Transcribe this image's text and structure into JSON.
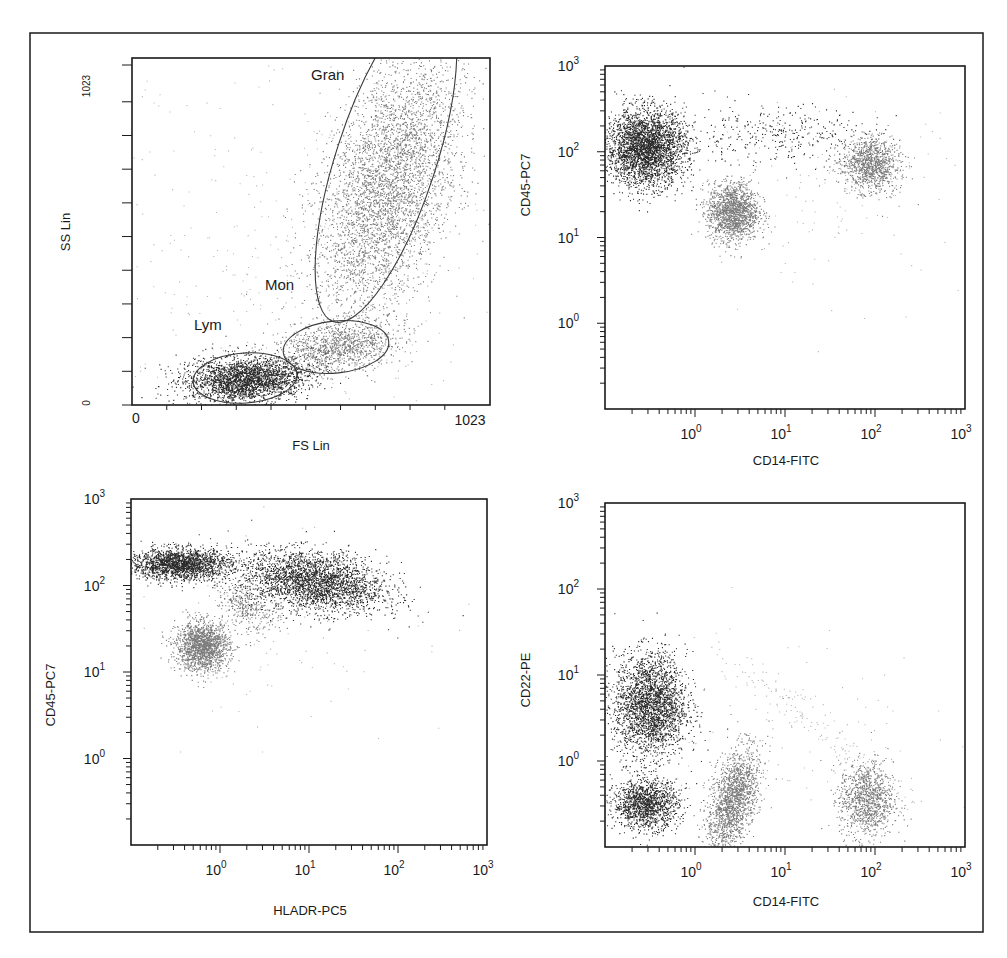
{
  "figure": {
    "frame": {
      "x": 30,
      "y": 33,
      "w": 953,
      "h": 899
    },
    "colors": {
      "dark": "#141414",
      "mid": "#6e6e6e",
      "light": "#9a9a9a",
      "axis": "#1a1a1a"
    }
  },
  "chart_data": [
    {
      "id": "fs-ss",
      "type": "scatter",
      "title": "",
      "xlabel": "FS Lin",
      "ylabel": "SS Lin",
      "scale": "linear",
      "xlim": [
        0,
        1023
      ],
      "ylim": [
        0,
        1023
      ],
      "x_tick_labels": [
        "0",
        "1023"
      ],
      "y_tick_labels": [
        "0",
        "1023"
      ],
      "box": {
        "x": 132,
        "y": 58,
        "w": 358,
        "h": 347
      },
      "gates": [
        {
          "label": "Lym",
          "shape": "ellipse",
          "cx": 245,
          "cy": 378,
          "rx": 52,
          "ry": 25,
          "rot": -4,
          "label_x": 194,
          "label_y": 330
        },
        {
          "label": "Mon",
          "shape": "ellipse",
          "cx": 336,
          "cy": 347,
          "rx": 53,
          "ry": 26,
          "rot": -6,
          "label_x": 265,
          "label_y": 290
        },
        {
          "label": "Gran",
          "shape": "ellipse-clipped",
          "cx": 386,
          "cy": 160,
          "rx": 50,
          "ry": 170,
          "rot": 18,
          "label_x": 311,
          "label_y": 80
        }
      ],
      "clusters": [
        {
          "name": "Lymphocytes",
          "shade": "dark",
          "cx": 245,
          "cy": 379,
          "sx": 30,
          "sy": 11,
          "rot": -3,
          "n": 2600
        },
        {
          "name": "Monocytes",
          "shade": "mid",
          "cx": 338,
          "cy": 346,
          "sx": 30,
          "sy": 12,
          "rot": -8,
          "n": 1100
        },
        {
          "name": "Granulocytes",
          "shade": "mid",
          "cx": 388,
          "cy": 185,
          "sx": 30,
          "sy": 70,
          "rot": 18,
          "n": 4200
        },
        {
          "name": "Debris",
          "shade": "light",
          "cx": 300,
          "cy": 260,
          "sx": 110,
          "sy": 110,
          "rot": 0,
          "n": 500
        }
      ]
    },
    {
      "id": "cd14-cd45",
      "type": "scatter",
      "title": "",
      "xlabel": "CD14-FITC",
      "ylabel": "CD45-PC7",
      "scale": "log",
      "xlim": [
        0.1,
        1000
      ],
      "ylim": [
        0.1,
        1000
      ],
      "x_tick_labels": [
        "10^0",
        "10^1",
        "10^2",
        "10^3"
      ],
      "y_tick_labels": [
        "10^0",
        "10^1",
        "10^2",
        "10^3"
      ],
      "box": {
        "x": 605,
        "y": 66,
        "w": 360,
        "h": 343
      },
      "clusters": [
        {
          "name": "Lymphocytes",
          "shade": "dark",
          "lx": -0.55,
          "ly": 2.05,
          "sx": 0.22,
          "sy": 0.22,
          "rot": 0,
          "n": 3200
        },
        {
          "name": "Granulocytes",
          "shade": "mid",
          "lx": 0.42,
          "ly": 1.3,
          "sx": 0.14,
          "sy": 0.17,
          "rot": 0,
          "n": 1600
        },
        {
          "name": "Monocytes",
          "shade": "mid",
          "lx": 1.95,
          "ly": 1.85,
          "sx": 0.16,
          "sy": 0.15,
          "rot": -30,
          "n": 1100
        },
        {
          "name": "Bridge",
          "shade": "dark",
          "lx": 0.9,
          "ly": 2.2,
          "sx": 0.55,
          "sy": 0.17,
          "rot": 0,
          "n": 350
        },
        {
          "name": "Scatter",
          "shade": "light",
          "lx": 1.6,
          "ly": 1.5,
          "sx": 0.7,
          "sy": 0.55,
          "rot": 0,
          "n": 120
        }
      ]
    },
    {
      "id": "hladr-cd45",
      "type": "scatter",
      "title": "",
      "xlabel": "HLADR-PC5",
      "ylabel": "CD45-PC7",
      "scale": "log",
      "xlim": [
        0.1,
        1000
      ],
      "ylim": [
        0.1,
        1000
      ],
      "x_tick_labels": [
        "10^0",
        "10^1",
        "10^2",
        "10^3"
      ],
      "y_tick_labels": [
        "10^0",
        "10^1",
        "10^2",
        "10^3"
      ],
      "box": {
        "x": 131,
        "y": 499,
        "w": 356,
        "h": 346
      },
      "clusters": [
        {
          "name": "HLADR- lymphocytes",
          "shade": "dark",
          "lx": -0.45,
          "ly": 2.25,
          "sx": 0.28,
          "sy": 0.09,
          "rot": 0,
          "n": 2000
        },
        {
          "name": "HLADR+ cells",
          "shade": "dark",
          "lx": 1.05,
          "ly": 2.05,
          "sx": 0.4,
          "sy": 0.17,
          "rot": -8,
          "n": 2800
        },
        {
          "name": "Granulocytes",
          "shade": "mid",
          "lx": -0.2,
          "ly": 1.3,
          "sx": 0.15,
          "sy": 0.14,
          "rot": 0,
          "n": 1700
        },
        {
          "name": "Bridge",
          "shade": "mid",
          "lx": 0.3,
          "ly": 1.75,
          "sx": 0.18,
          "sy": 0.12,
          "rot": -40,
          "n": 350
        },
        {
          "name": "Scatter",
          "shade": "light",
          "lx": 0.6,
          "ly": 1.6,
          "sx": 0.8,
          "sy": 0.55,
          "rot": 0,
          "n": 120
        }
      ]
    },
    {
      "id": "cd14-cd22",
      "type": "scatter",
      "title": "",
      "xlabel": "CD14-FITC",
      "ylabel": "CD22-PE",
      "scale": "log",
      "xlim": [
        0.1,
        1000
      ],
      "ylim": [
        0.1,
        1000
      ],
      "x_tick_labels": [
        "10^0",
        "10^1",
        "10^2",
        "10^3"
      ],
      "y_tick_labels": [
        "10^0",
        "10^1",
        "10^2",
        "10^3"
      ],
      "box": {
        "x": 605,
        "y": 503,
        "w": 360,
        "h": 344
      },
      "clusters": [
        {
          "name": "B cells (CD22+)",
          "shade": "dark",
          "lx": -0.5,
          "ly": 0.65,
          "sx": 0.2,
          "sy": 0.3,
          "rot": 0,
          "n": 2600
        },
        {
          "name": "T/NK cells (CD22-)",
          "shade": "dark",
          "lx": -0.55,
          "ly": -0.5,
          "sx": 0.18,
          "sy": 0.14,
          "rot": 0,
          "n": 1400
        },
        {
          "name": "Granulocytes",
          "shade": "mid",
          "lx": 0.42,
          "ly": -0.45,
          "sx": 0.12,
          "sy": 0.3,
          "rot": -15,
          "n": 1700
        },
        {
          "name": "Monocytes",
          "shade": "mid",
          "lx": 1.9,
          "ly": -0.45,
          "sx": 0.15,
          "sy": 0.22,
          "rot": 0,
          "n": 1100
        },
        {
          "name": "Diagonal",
          "shade": "light",
          "lx": 1.4,
          "ly": 0.4,
          "sx": 0.8,
          "sy": 0.1,
          "rot": -38,
          "n": 160
        },
        {
          "name": "Scatter",
          "shade": "light",
          "lx": 0.8,
          "ly": 0.3,
          "sx": 0.9,
          "sy": 0.7,
          "rot": 0,
          "n": 120
        }
      ]
    }
  ]
}
